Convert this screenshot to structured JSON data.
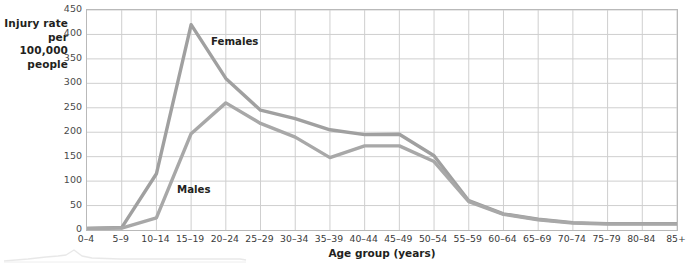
{
  "figure": {
    "y_axis_title": "Injury rate per 100,000 people",
    "x_axis_title": "Age group (years)",
    "series_label_females": "Females",
    "series_label_males": "Males"
  },
  "chart_data": {
    "type": "line",
    "title": "",
    "xlabel": "Age group (years)",
    "ylabel": "Injury rate per 100,000 people",
    "ylim": [
      0,
      450
    ],
    "yticks": [
      0,
      50,
      100,
      150,
      200,
      250,
      300,
      350,
      400,
      450
    ],
    "ytick_labels": [
      "0",
      "50",
      "100",
      "150",
      "200",
      "250",
      "300",
      "350",
      "400",
      "450"
    ],
    "grid": true,
    "legend_position": "inline-annotation",
    "categories": [
      "0–4",
      "5–9",
      "10–14",
      "15–19",
      "20–24",
      "25–29",
      "30–34",
      "35–39",
      "40–44",
      "45–49",
      "50–54",
      "55–59",
      "60–64",
      "65–69",
      "70–74",
      "75–79",
      "80–84",
      "85+"
    ],
    "series": [
      {
        "name": "Females",
        "color": "#a0a0a0",
        "values": [
          3,
          5,
          115,
          420,
          310,
          245,
          228,
          205,
          195,
          196,
          152,
          60,
          33,
          22,
          15,
          13,
          13,
          13
        ]
      },
      {
        "name": "Males",
        "color": "#a8a8a8",
        "values": [
          3,
          4,
          25,
          197,
          260,
          218,
          190,
          148,
          172,
          172,
          140,
          58,
          32,
          21,
          14,
          12,
          12,
          12
        ]
      }
    ],
    "annotations": [
      {
        "text": "Females",
        "category": "20–24",
        "value": 390
      },
      {
        "text": "Males",
        "category": "15–19",
        "value": 70
      }
    ],
    "colors": {
      "line": "#a0a0a0",
      "grid": "#cfcfcf",
      "frame": "#b9b9b9",
      "text": "#231f20",
      "background": "#ffffff"
    }
  }
}
